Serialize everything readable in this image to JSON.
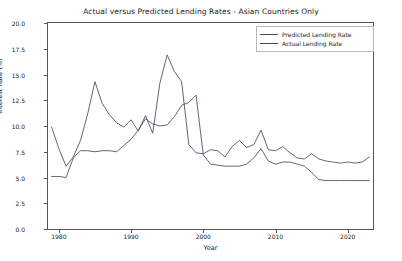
{
  "chart_data": {
    "type": "line",
    "title": "Actual versus Predicted Lending Rates - Asian Countries Only",
    "xlabel": "Year",
    "ylabel": "Interest Rate (%)",
    "xlim": [
      1978.5,
      2023.5
    ],
    "ylim": [
      0.0,
      20.0
    ],
    "grid": false,
    "legend_position": "upper right",
    "yticks": [
      "0.0",
      "2.5",
      "5.0",
      "7.5",
      "10.0",
      "12.5",
      "15.0",
      "17.5",
      "20.0"
    ],
    "ytick_values": [
      0.0,
      2.5,
      5.0,
      7.5,
      10.0,
      12.5,
      15.0,
      17.5,
      20.0
    ],
    "xticks": [
      "1980",
      "1990",
      "2000",
      "2010",
      "2020"
    ],
    "xtick_values": [
      1980,
      1990,
      2000,
      2010,
      2020
    ],
    "x": [
      1979,
      1980,
      1981,
      1982,
      1983,
      1984,
      1985,
      1986,
      1987,
      1988,
      1989,
      1990,
      1991,
      1992,
      1993,
      1994,
      1995,
      1996,
      1997,
      1998,
      1999,
      2000,
      2001,
      2002,
      2003,
      2004,
      2005,
      2006,
      2007,
      2008,
      2009,
      2010,
      2011,
      2012,
      2013,
      2014,
      2015,
      2016,
      2017,
      2018,
      2019,
      2020,
      2021,
      2022,
      2023
    ],
    "series": [
      {
        "name": "Predicted Lending Rate",
        "color": "#4a4a5a",
        "values": [
          9.9,
          7.8,
          6.1,
          7.0,
          8.6,
          11.2,
          14.3,
          12.2,
          11.1,
          10.3,
          9.9,
          10.6,
          9.5,
          11.0,
          9.3,
          14.2,
          16.9,
          15.3,
          14.3,
          8.2,
          7.4,
          7.3,
          7.7,
          7.6,
          7.0,
          8.0,
          8.6,
          7.9,
          8.2,
          9.6,
          7.7,
          7.6,
          8.0,
          7.4,
          6.9,
          6.8,
          7.3,
          6.8,
          6.6,
          6.5,
          6.4,
          6.5,
          6.4,
          6.5,
          7.0
        ]
      },
      {
        "name": "Actual Lending Rate",
        "color": "#4a4a5a",
        "values": [
          5.1,
          5.1,
          5.0,
          6.9,
          7.6,
          7.6,
          7.5,
          7.6,
          7.6,
          7.5,
          8.1,
          8.7,
          9.6,
          10.7,
          10.2,
          10.0,
          10.1,
          10.9,
          12.0,
          12.3,
          13.0,
          7.2,
          6.3,
          6.2,
          6.1,
          6.1,
          6.1,
          6.3,
          6.9,
          7.8,
          6.6,
          6.3,
          6.5,
          6.5,
          6.3,
          6.1,
          5.5,
          4.8,
          4.7,
          4.7,
          4.7,
          4.7,
          4.7,
          4.7,
          4.7
        ]
      }
    ]
  },
  "legend": {
    "items": [
      {
        "label": "Predicted Lending Rate"
      },
      {
        "label": "Actual Lending Rate"
      }
    ]
  }
}
